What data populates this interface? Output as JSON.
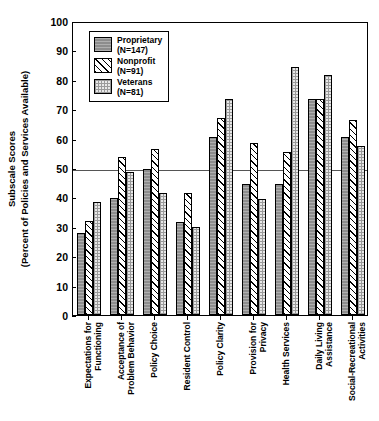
{
  "chart_data": {
    "type": "bar",
    "title": "",
    "xlabel": "",
    "ylabel": "Subscale Scores (Percent of Policies and Services Available)",
    "ylabel_line1": "Subscale Scores",
    "ylabel_line2": "(Percent of Policies and Services Available)",
    "ylim": [
      0,
      100
    ],
    "yticks": [
      0,
      10,
      20,
      30,
      40,
      50,
      60,
      70,
      80,
      90,
      100
    ],
    "grid": false,
    "reference_line": 50,
    "legend_position": "top-left",
    "categories": [
      "Expectations for Functioning",
      "Acceptance of Problem Behavior",
      "Policy Choice",
      "Resident Control",
      "Policy Clarity",
      "Provision for Privacy",
      "Health Services",
      "Daily Living Assistance",
      "Social-Recreational Activities"
    ],
    "category_lines": [
      [
        "Expectations for",
        "Functioning"
      ],
      [
        "Acceptance of",
        "Problem Behavior"
      ],
      [
        "Policy Choice",
        ""
      ],
      [
        "Resident Control",
        ""
      ],
      [
        "Policy Clarity",
        ""
      ],
      [
        "Provision for",
        "Privacy"
      ],
      [
        "Health Services",
        ""
      ],
      [
        "Daily Living",
        "Assistance"
      ],
      [
        "Social-Recreational",
        "Activities"
      ]
    ],
    "series": [
      {
        "name": "Proprietary",
        "n_label": "(N=147)",
        "pattern": "solid-gray",
        "color": "#8d8d8d",
        "values": [
          28.0,
          39.8,
          49.8,
          31.5,
          60.5,
          44.5,
          44.5,
          73.5,
          60.5
        ]
      },
      {
        "name": "Nonprofit",
        "n_label": "(N=91)",
        "pattern": "diagonal-hatch",
        "color": "#ffffff",
        "values": [
          32.0,
          53.8,
          56.5,
          41.5,
          67.0,
          58.5,
          55.5,
          73.5,
          66.5
        ]
      },
      {
        "name": "Veterans",
        "n_label": "(N=81)",
        "pattern": "light-dotted",
        "color": "#e8e8e8",
        "values": [
          38.5,
          48.8,
          41.5,
          30.0,
          73.5,
          39.5,
          84.5,
          81.5,
          57.5
        ]
      }
    ]
  },
  "caption": {
    "text": ""
  }
}
